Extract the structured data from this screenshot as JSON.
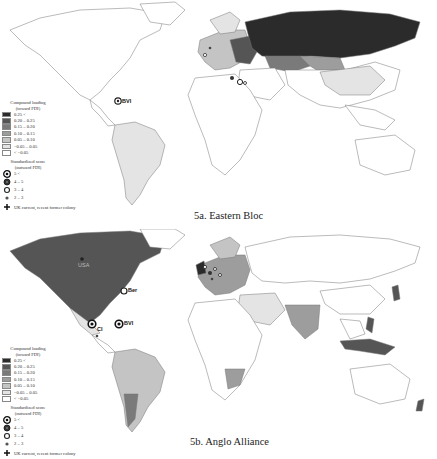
{
  "panels": [
    {
      "id": "5a",
      "caption": "5a. Eastern Bloc",
      "map_labels": [
        {
          "text": "BVI",
          "x": 124,
          "y": 101
        }
      ],
      "legend": {
        "fill_title_1": "Compound loading",
        "fill_title_2": "(toward FDI)",
        "fill_classes": [
          {
            "label": "0.25 <",
            "color": "#2b2b2b"
          },
          {
            "label": "0.20 – 0.25",
            "color": "#555555"
          },
          {
            "label": "0.15 – 0.20",
            "color": "#7a7a7a"
          },
          {
            "label": "0.10 – 0.15",
            "color": "#9d9d9d"
          },
          {
            "label": "0.05 – 0.10",
            "color": "#c4c4c4"
          },
          {
            "label": "−0.05 – 0.05",
            "color": "#e4e4e4"
          },
          {
            "label": "< −0.05",
            "color": "#ffffff"
          }
        ],
        "symbol_title_1": "Standardized score",
        "symbol_title_2": "(outward FDI)",
        "symbol_classes": [
          {
            "label": "5 <"
          },
          {
            "label": "4 – 5"
          },
          {
            "label": "3 – 4"
          },
          {
            "label": "2 – 3"
          }
        ],
        "plus_label": "UK current, recent former colony"
      }
    },
    {
      "id": "5b",
      "caption": "5b. Anglo Alliance",
      "map_labels": [
        {
          "text": "Ber",
          "x": 126,
          "y": 62
        },
        {
          "text": "BVI",
          "x": 124,
          "y": 95
        },
        {
          "text": "CI",
          "x": 97,
          "y": 97
        },
        {
          "text": "USA",
          "x": 80,
          "y": 33
        }
      ],
      "legend": {
        "fill_title_1": "Compound loading",
        "fill_title_2": "(toward FDI)",
        "fill_classes": [
          {
            "label": "0.25 <",
            "color": "#2b2b2b"
          },
          {
            "label": "0.20 – 0.25",
            "color": "#555555"
          },
          {
            "label": "0.15 – 0.20",
            "color": "#7a7a7a"
          },
          {
            "label": "0.10 – 0.15",
            "color": "#9d9d9d"
          },
          {
            "label": "0.05 – 0.10",
            "color": "#c4c4c4"
          },
          {
            "label": "−0.05 – 0.05",
            "color": "#e4e4e4"
          },
          {
            "label": "< −0.05",
            "color": "#ffffff"
          }
        ],
        "symbol_title_1": "Standardized score",
        "symbol_title_2": "(outward FDI)",
        "symbol_classes": [
          {
            "label": "5 <"
          },
          {
            "label": "4 – 5"
          },
          {
            "label": "3 – 4"
          },
          {
            "label": "2 – 3"
          }
        ],
        "plus_label": "UK current, recent former colony"
      }
    }
  ]
}
